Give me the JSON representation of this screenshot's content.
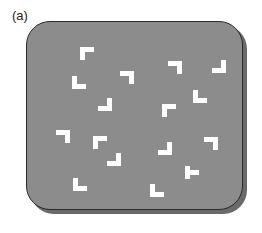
{
  "figure": {
    "label": "(a)",
    "panel_color": "#8c8c8c",
    "shape_color": "#ffffff",
    "stimuli": [
      {
        "type": "L",
        "orientation": "top-left",
        "x": 80,
        "y": 47
      },
      {
        "type": "L",
        "orientation": "bottom-left",
        "x": 72,
        "y": 76
      },
      {
        "type": "L",
        "orientation": "top-right",
        "x": 120,
        "y": 71
      },
      {
        "type": "L",
        "orientation": "top-right",
        "x": 168,
        "y": 61
      },
      {
        "type": "L",
        "orientation": "bottom-right",
        "x": 212,
        "y": 60
      },
      {
        "type": "L",
        "orientation": "bottom-right",
        "x": 98,
        "y": 98
      },
      {
        "type": "L",
        "orientation": "top-left",
        "x": 162,
        "y": 104
      },
      {
        "type": "L",
        "orientation": "bottom-left",
        "x": 193,
        "y": 90
      },
      {
        "type": "L",
        "orientation": "top-right",
        "x": 56,
        "y": 130
      },
      {
        "type": "L",
        "orientation": "top-left",
        "x": 93,
        "y": 136
      },
      {
        "type": "L",
        "orientation": "bottom-right",
        "x": 107,
        "y": 153
      },
      {
        "type": "L",
        "orientation": "bottom-right",
        "x": 158,
        "y": 142
      },
      {
        "type": "L",
        "orientation": "top-right",
        "x": 204,
        "y": 137
      },
      {
        "type": "L",
        "orientation": "bottom-left",
        "x": 73,
        "y": 178
      },
      {
        "type": "L",
        "orientation": "bottom-left",
        "x": 150,
        "y": 184
      },
      {
        "type": "T",
        "orientation": "right",
        "x": 185,
        "y": 166
      }
    ]
  }
}
